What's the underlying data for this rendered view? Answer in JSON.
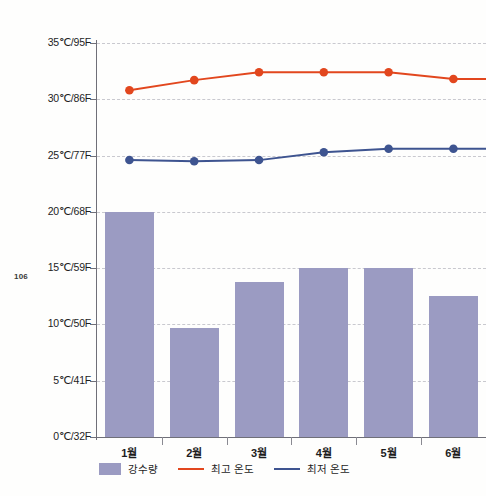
{
  "page": {
    "folio": "106"
  },
  "chart_data": {
    "type": "bar",
    "title": "",
    "subtitle": "",
    "xlabel": "",
    "ylabel": "",
    "ylim": [
      0,
      35
    ],
    "grid": true,
    "legend_position": "bottom-left",
    "categories": [
      "1월",
      "2월",
      "3월",
      "4월",
      "5월",
      "6월"
    ],
    "ytick_labels": [
      "0℃/32F",
      "5℃/41F",
      "10℃/50F",
      "15℃/59F",
      "20℃/68F",
      "25℃/77F",
      "30℃/86F",
      "35℃/95F"
    ],
    "ytick_values": [
      0,
      5,
      10,
      15,
      20,
      25,
      30,
      35
    ],
    "series": [
      {
        "name": "강수량",
        "type": "bar",
        "color": "#9b9bc2",
        "values": [
          20.0,
          9.7,
          13.8,
          15.0,
          15.0,
          12.5
        ]
      },
      {
        "name": "최고 온도",
        "type": "line",
        "color": "#e2471e",
        "values": [
          30.8,
          31.7,
          32.4,
          32.4,
          32.4,
          31.8
        ]
      },
      {
        "name": "최저 온도",
        "type": "line",
        "color": "#3e5490",
        "values": [
          24.6,
          24.5,
          24.6,
          25.3,
          25.6,
          25.6
        ]
      }
    ]
  },
  "legend": {
    "items": [
      {
        "label": "강수량",
        "marker": "bar-swatch",
        "color": "#9b9bc2"
      },
      {
        "label": "최고 온도",
        "marker": "line-swatch",
        "color": "#e2471e"
      },
      {
        "label": "최저 온도",
        "marker": "line-swatch",
        "color": "#3e5490"
      }
    ]
  }
}
